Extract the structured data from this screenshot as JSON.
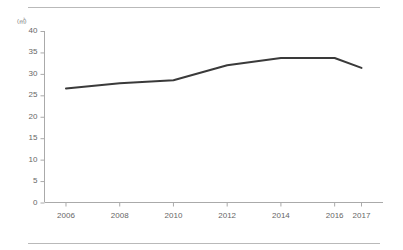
{
  "chart_data": {
    "type": "line",
    "title": "",
    "subtitle": "",
    "xlabel": "",
    "ylabel": "",
    "unit_label": "(㎡)",
    "categories": [
      "2006",
      "2008",
      "2010",
      "2012",
      "2014",
      "2016",
      "2017"
    ],
    "x": [
      2006,
      2008,
      2010,
      2012,
      2014,
      2016,
      2017
    ],
    "values": [
      26.6,
      27.8,
      28.5,
      32.0,
      33.7,
      33.7,
      31.4
    ],
    "series": [
      {
        "name": "",
        "values": [
          26.6,
          27.8,
          28.5,
          32.0,
          33.7,
          33.7,
          31.4
        ]
      }
    ],
    "ylim": [
      0,
      40
    ],
    "xlim": [
      2005.2,
      2017.8
    ],
    "yticks": [
      0,
      5,
      10,
      15,
      20,
      25,
      30,
      35,
      40
    ],
    "ytick_labels": [
      "0",
      "5",
      "10",
      "15",
      "20",
      "25",
      "30",
      "35",
      "40"
    ],
    "xtick_labels": [
      "2006",
      "2008",
      "2010",
      "2012",
      "2014",
      "2016",
      "2017"
    ],
    "grid": false,
    "legend": "none",
    "line_color": "#3a3a3a",
    "axis_color": "#aaaaaa",
    "tick_text_color": "#666666",
    "rule_color": "#b9b9b9",
    "markers": false,
    "annotations": []
  },
  "figure": {
    "background_color": "#ffffff",
    "top_rule": "",
    "bottom_rule": ""
  }
}
